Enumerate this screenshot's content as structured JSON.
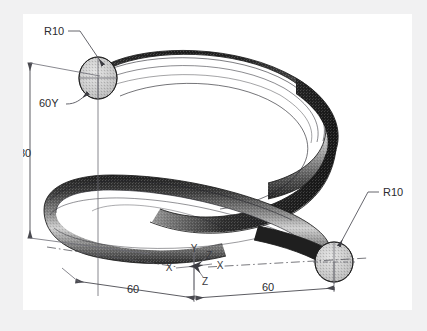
{
  "drawing": {
    "title": "helical-coil-isometric-technical-drawing",
    "subject": "Helical coil / spring shown in isometric projection with dimensions",
    "paper": {
      "background_color": "#ffffff",
      "surround_color": "#f1f1f2"
    },
    "style": {
      "line_color": "#4a4a50",
      "text_color": "#2b2b2f",
      "tube_dark": "#1d1d1d",
      "tube_mid": "#6e6e6e",
      "tube_light": "#e2e2e2",
      "cap_fill": "#c9c9c9"
    }
  },
  "annotations": {
    "radius_top_left": {
      "label": "R10",
      "description": "radius callout pointing to upper-left circular end face"
    },
    "radius_bottom_right": {
      "label": "R10",
      "description": "radius callout pointing to lower-right circular end face"
    },
    "offset_y": {
      "label": "60Y",
      "description": "leader note to upper end face, vertical offset along Y"
    },
    "height": {
      "label": "80",
      "description": "overall vertical dimension between upper and lower coil centres"
    },
    "width_left": {
      "label": "60",
      "description": "horizontal dimension from left extremity to origin"
    },
    "width_right": {
      "label": "60",
      "description": "horizontal dimension from origin to right extremity"
    }
  },
  "axes": {
    "origin_label": "origin",
    "labels": [
      {
        "name": "y-axis-label",
        "text": "Y"
      },
      {
        "name": "x-axis-label-left",
        "text": "X"
      },
      {
        "name": "x-axis-label-right",
        "text": "X"
      },
      {
        "name": "z-axis-label-upper",
        "text": "Z"
      },
      {
        "name": "z-axis-label-lower",
        "text": "Z"
      }
    ]
  }
}
